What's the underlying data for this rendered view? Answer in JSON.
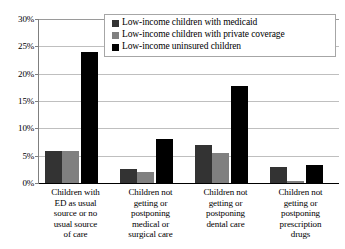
{
  "chart_data": {
    "type": "bar",
    "title": "",
    "xlabel": "",
    "ylabel": "",
    "ylim": [
      0,
      30
    ],
    "ytick_labels": [
      "30%",
      "25%",
      "20%",
      "15%",
      "10%",
      "5%",
      "0%"
    ],
    "ytick_values": [
      30,
      25,
      20,
      15,
      10,
      5,
      0
    ],
    "grid": true,
    "legend_position": "top-right-inside",
    "categories": [
      "Children with ED as usual source or no usual source of care",
      "Children not getting or postponing medical or surgical care",
      "Children not getting or postponing dental care",
      "Children not getting or postponing prescription drugs"
    ],
    "category_lines": [
      [
        "Children with",
        "ED as usual",
        "source or no",
        "usual source",
        "of care"
      ],
      [
        "Children not",
        "getting or",
        "postponing",
        "medical or",
        "surgical care"
      ],
      [
        "Children not",
        "getting or",
        "postponing",
        "dental care"
      ],
      [
        "Children not",
        "getting or",
        "postponing",
        "prescription",
        "drugs"
      ]
    ],
    "series": [
      {
        "name": "Low-income children with medicaid",
        "color": "#333333",
        "values": [
          5.9,
          2.5,
          7.0,
          3.0
        ]
      },
      {
        "name": "Low-income children with private coverage",
        "color": "#808080",
        "values": [
          5.8,
          2.0,
          5.5,
          0.3
        ]
      },
      {
        "name": "Low-income uninsured children",
        "color": "#000000",
        "values": [
          24.0,
          8.0,
          17.8,
          3.3
        ]
      }
    ]
  }
}
